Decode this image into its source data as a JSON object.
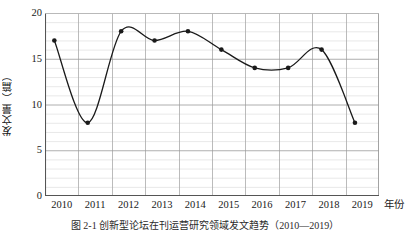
{
  "chart_data": {
    "type": "line",
    "title": "",
    "caption": "图 2-1  创新型论坛在刊运营研究领域发文趋势（2010—2019）",
    "xlabel": "年份",
    "ylabel": "发文量（篇）",
    "categories": [
      "2010",
      "2011",
      "2012",
      "2013",
      "2014",
      "2015",
      "2016",
      "2017",
      "2018",
      "2019"
    ],
    "values": [
      17,
      8,
      18,
      17,
      18,
      16,
      14,
      14,
      16,
      8
    ],
    "series": [
      {
        "name": "发文量",
        "values": [
          17,
          8,
          18,
          17,
          18,
          16,
          14,
          14,
          16,
          8
        ],
        "color": "#1a1a1a",
        "marker": "circle",
        "smooth": true
      }
    ],
    "ylim": [
      0,
      20
    ],
    "yticks": [
      0,
      5,
      10,
      15,
      20
    ],
    "ytick_labels": [
      "0",
      "5",
      "10",
      "15",
      "20"
    ],
    "y_minor_step": 1,
    "grid": true,
    "grid_major_color": "#9a9a9a",
    "grid_minor_color": "#e2e2e2",
    "axis_color": "#555555",
    "legend": "none",
    "background": "#ffffff"
  }
}
